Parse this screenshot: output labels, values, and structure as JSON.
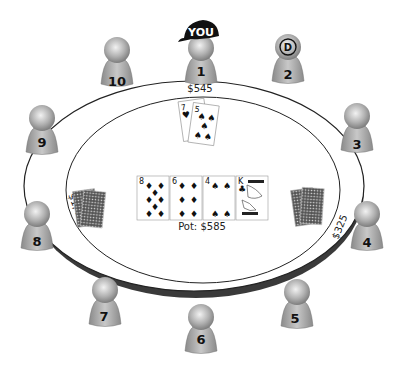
{
  "table": {
    "pot_label": "Pot: $585",
    "colors": {
      "felt": "#ffffff",
      "rim": "#444444",
      "seat": "#9a9a9a"
    }
  },
  "hero": {
    "seat": "1",
    "badge": "YOU",
    "stack": "$545",
    "hole_cards": [
      {
        "rank": "7",
        "suit": "♥"
      },
      {
        "rank": "5",
        "suit": "♠"
      }
    ]
  },
  "dealer": {
    "seat": "2",
    "badge": "D"
  },
  "seats": [
    {
      "number": "1"
    },
    {
      "number": "2"
    },
    {
      "number": "3"
    },
    {
      "number": "4"
    },
    {
      "number": "5"
    },
    {
      "number": "6"
    },
    {
      "number": "7"
    },
    {
      "number": "8"
    },
    {
      "number": "9"
    },
    {
      "number": "10"
    }
  ],
  "opponents_in_hand": [
    {
      "seat": "8",
      "stack": "$1,425",
      "cards": "face-down"
    },
    {
      "seat": "4",
      "stack": "$325",
      "cards": "face-down"
    }
  ],
  "board": [
    {
      "rank": "8",
      "suit": "♦"
    },
    {
      "rank": "6",
      "suit": "♦"
    },
    {
      "rank": "4",
      "suit": "♠"
    },
    {
      "rank": "K",
      "suit": "♣"
    }
  ]
}
